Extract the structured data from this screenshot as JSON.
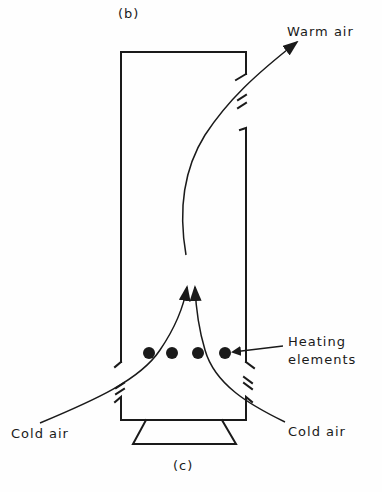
{
  "figure": {
    "panel_top_label": "(b)",
    "panel_bottom_label": "(c)",
    "labels": {
      "warm_air": "Warm air",
      "heating_line1": "Heating",
      "heating_line2": "elements",
      "cold_air_left": "Cold air",
      "cold_air_right": "Cold air"
    },
    "heating_element_count": 4,
    "colors": {
      "ink": "#1a1a1a",
      "background": "#fefefe"
    }
  }
}
